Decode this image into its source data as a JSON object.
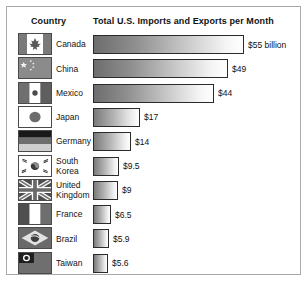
{
  "figure": {
    "headers": {
      "country": "Country",
      "metric": "Total U.S. Imports and Exports per Month"
    }
  },
  "chart_data": {
    "type": "bar",
    "title": "Total U.S. Imports and Exports per Month",
    "xlabel": "",
    "ylabel": "Country",
    "orientation": "horizontal",
    "unit": "billion USD per month",
    "grid": false,
    "legend": null,
    "xlim": [
      0,
      55
    ],
    "categories": [
      "Canada",
      "China",
      "Mexico",
      "Japan",
      "Germany",
      "South Korea",
      "United Kingdom",
      "France",
      "Brazil",
      "Taiwan"
    ],
    "values": [
      55,
      49,
      44,
      17,
      14,
      9.5,
      9,
      6.5,
      5.9,
      5.6
    ],
    "labels": [
      "$55 billion",
      "$49",
      "$44",
      "$17",
      "$14",
      "$9.5",
      "$9",
      "$6.5",
      "$5.9",
      "$5.6"
    ],
    "rows": [
      {
        "country": "Canada",
        "flag": "flag-canada",
        "value": 55,
        "label": "$55 billion"
      },
      {
        "country": "China",
        "flag": "flag-china",
        "value": 49,
        "label": "$49"
      },
      {
        "country": "Mexico",
        "flag": "flag-mexico",
        "value": 44,
        "label": "$44"
      },
      {
        "country": "Japan",
        "flag": "flag-japan",
        "value": 17,
        "label": "$17"
      },
      {
        "country": "Germany",
        "flag": "flag-germany",
        "value": 14,
        "label": "$14"
      },
      {
        "country": "South Korea",
        "flag": "flag-south-korea",
        "value": 9.5,
        "label": "$9.5"
      },
      {
        "country": "United\nKingdom",
        "flag": "flag-united-kingdom",
        "value": 9,
        "label": "$9"
      },
      {
        "country": "France",
        "flag": "flag-france",
        "value": 6.5,
        "label": "$6.5"
      },
      {
        "country": "Brazil",
        "flag": "flag-brazil",
        "value": 5.9,
        "label": "$5.9"
      },
      {
        "country": "Taiwan",
        "flag": "flag-taiwan",
        "value": 5.6,
        "label": "$5.6"
      }
    ]
  }
}
